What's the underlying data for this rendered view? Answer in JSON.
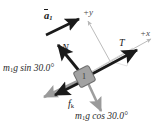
{
  "figure": {
    "type": "free-body-diagram",
    "background_color": "#ffffff",
    "colors": {
      "dark_vector": "#1a1a1a",
      "gray_vector": "#9a9a9a",
      "axis_line": "#b8b8b8",
      "block_fill": "#9e9e9e",
      "block_stroke": "#6b6b6b",
      "text": "#1a1a1a"
    },
    "axes": {
      "x_label": "+x",
      "y_label": "+y",
      "tilt_degrees": 30.0
    },
    "block": {
      "label": "1",
      "name": "block-1"
    },
    "vectors": [
      {
        "name": "acceleration",
        "label": "a",
        "subscript": "1",
        "style": "dark",
        "direction": "up-right along incline",
        "has_vector_arrow": true
      },
      {
        "name": "normal-force",
        "label": "N",
        "style": "dark",
        "direction": "up-left perpendicular to incline"
      },
      {
        "name": "tension",
        "label": "T",
        "style": "dark",
        "direction": "up-right along incline"
      },
      {
        "name": "kinetic-friction",
        "label": "f",
        "subscript": "k",
        "style": "dark",
        "direction": "down-left along incline"
      },
      {
        "name": "gravity-parallel-component",
        "label": "m₁g sin 30.0°",
        "label_base": "g sin 30.0°",
        "mass_symbol": "m",
        "mass_subscript": "1",
        "style": "gray",
        "direction": "down-left along incline"
      },
      {
        "name": "gravity-perpendicular-component",
        "label": "m₁g cos 30.0°",
        "label_base": "g cos 30.0°",
        "mass_symbol": "m",
        "mass_subscript": "1",
        "style": "gray",
        "direction": "down-right perpendicular to incline"
      }
    ]
  }
}
